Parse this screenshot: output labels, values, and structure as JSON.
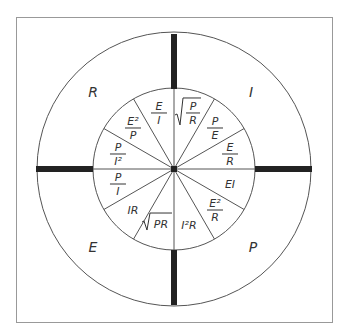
{
  "diagram": {
    "colors": {
      "line": "#555555",
      "bar": "#222222",
      "text": "#333333",
      "frame": "#999999"
    },
    "quadrants": [
      {
        "id": "R",
        "label": "R",
        "formulas": [
          {
            "kind": "frac",
            "num": "P",
            "den": "I²"
          },
          {
            "kind": "frac",
            "num": "E²",
            "den": "P"
          },
          {
            "kind": "frac",
            "num": "E",
            "den": "I"
          }
        ]
      },
      {
        "id": "I",
        "label": "I",
        "formulas": [
          {
            "kind": "sqrtfrac",
            "num": "P",
            "den": "R"
          },
          {
            "kind": "frac",
            "num": "P",
            "den": "E"
          },
          {
            "kind": "frac",
            "num": "E",
            "den": "R"
          }
        ]
      },
      {
        "id": "P",
        "label": "P",
        "formulas": [
          {
            "kind": "text",
            "text": "EI"
          },
          {
            "kind": "frac",
            "num": "E²",
            "den": "R"
          },
          {
            "kind": "text",
            "text": "I²R"
          }
        ]
      },
      {
        "id": "E",
        "label": "E",
        "formulas": [
          {
            "kind": "sqrt",
            "text": "PR"
          },
          {
            "kind": "text",
            "text": "IR"
          },
          {
            "kind": "frac",
            "num": "P",
            "den": "I"
          }
        ]
      }
    ]
  }
}
